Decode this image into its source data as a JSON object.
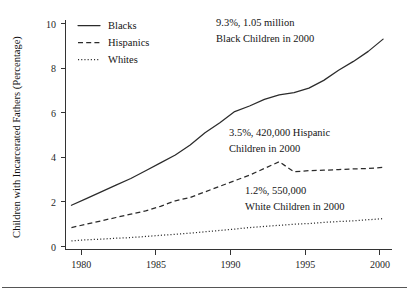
{
  "chart_data": {
    "type": "line",
    "title": "",
    "xlabel": "",
    "ylabel": "Children with Incarcerated Fathers (Percentage)",
    "xlim": [
      1978.6,
      2000.6
    ],
    "ylim": [
      0,
      10
    ],
    "grid": false,
    "legend_position": "top-left",
    "xticks": [
      "1980",
      "1985",
      "1990",
      "1995",
      "2000"
    ],
    "xtick_values": [
      1980,
      1985,
      1990,
      1995,
      2000
    ],
    "yticks": [
      "0",
      "2",
      "4",
      "6",
      "8",
      "10"
    ],
    "ytick_values": [
      0,
      2,
      4,
      6,
      8,
      10
    ],
    "x": [
      1979,
      1980,
      1981,
      1982,
      1983,
      1984,
      1985,
      1986,
      1987,
      1988,
      1989,
      1990,
      1991,
      1992,
      1993,
      1994,
      1995,
      1996,
      1997,
      1998,
      1999,
      2000
    ],
    "series": [
      {
        "name": "Blacks",
        "style": "solid",
        "values": [
          1.85,
          2.15,
          2.45,
          2.75,
          3.05,
          3.4,
          3.75,
          4.1,
          4.55,
          5.1,
          5.55,
          6.05,
          6.3,
          6.6,
          6.8,
          6.9,
          7.1,
          7.45,
          7.9,
          8.3,
          8.75,
          9.3
        ]
      },
      {
        "name": "Hispanics",
        "style": "dashed",
        "values": [
          0.85,
          1.0,
          1.15,
          1.3,
          1.45,
          1.6,
          1.8,
          2.05,
          2.2,
          2.45,
          2.7,
          2.95,
          3.2,
          3.5,
          3.8,
          3.35,
          3.4,
          3.42,
          3.45,
          3.48,
          3.5,
          3.55
        ]
      },
      {
        "name": "Whites",
        "style": "dotted",
        "values": [
          0.25,
          0.3,
          0.33,
          0.37,
          0.4,
          0.45,
          0.5,
          0.55,
          0.6,
          0.66,
          0.72,
          0.78,
          0.85,
          0.9,
          0.95,
          1.0,
          1.03,
          1.08,
          1.12,
          1.15,
          1.2,
          1.25
        ]
      }
    ],
    "annotations": [
      {
        "id": "blacks-annotation",
        "lines": [
          "9.3%, 1.05 million",
          "Black Children in 2000"
        ],
        "x": 1990.2,
        "y": 9.85
      },
      {
        "id": "hispanics-annotation",
        "lines": [
          "3.5%, 420,000 Hispanic",
          "Children in 2000"
        ],
        "x": 1991.2,
        "y": 4.85
      },
      {
        "id": "whites-annotation",
        "lines": [
          "1.2%, 550,000",
          "White Children in 2000"
        ],
        "x": 1992.0,
        "y": 2.45
      }
    ],
    "legend_entries": [
      {
        "label": "Blacks",
        "style": "solid"
      },
      {
        "label": "Hispanics",
        "style": "dashed"
      },
      {
        "label": "Whites",
        "style": "dotted"
      }
    ]
  }
}
